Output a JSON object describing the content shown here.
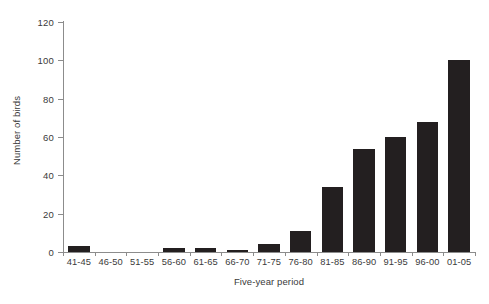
{
  "chart_data": {
    "type": "bar",
    "title": "",
    "subtitle": "",
    "xlabel": "Five-year period",
    "ylabel": "Number of birds",
    "categories": [
      "41-45",
      "46-50",
      "51-55",
      "56-60",
      "61-65",
      "66-70",
      "71-75",
      "76-80",
      "81-85",
      "86-90",
      "91-95",
      "96-00",
      "01-05"
    ],
    "values": [
      3,
      0,
      0,
      2,
      2,
      1,
      4,
      11,
      34,
      54,
      60,
      68,
      100
    ],
    "ylim": [
      0,
      120
    ],
    "yticks": [
      0,
      20,
      40,
      60,
      80,
      100,
      120
    ],
    "ytick_labels": [
      "0",
      "20",
      "40",
      "60",
      "80",
      "100",
      "120"
    ],
    "grid": false,
    "legend": false,
    "legend_position": "none",
    "bar_color": "#231f20",
    "axis_color": "#8c8c8c",
    "text_color": "#3a3a3a",
    "background_color": "#ffffff"
  }
}
